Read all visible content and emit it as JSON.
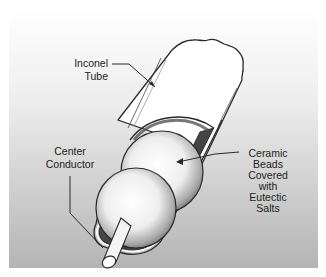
{
  "diagram": {
    "labels": {
      "inconel_tube": [
        "Inconel",
        "Tube"
      ],
      "center_conductor": [
        "Center",
        "Conductor"
      ],
      "ceramic_beads": [
        "Ceramic",
        "Beads",
        "Covered",
        "with",
        "Eutectic",
        "Salts"
      ]
    },
    "colors": {
      "panel_top": "#ffffff",
      "panel_bottom": "#b4b4b4",
      "outline": "#2a2a2a",
      "tube_fill": "#ffffff",
      "bead_highlight": "#ffffff",
      "bead_shadow": "#7a7a7a"
    }
  }
}
